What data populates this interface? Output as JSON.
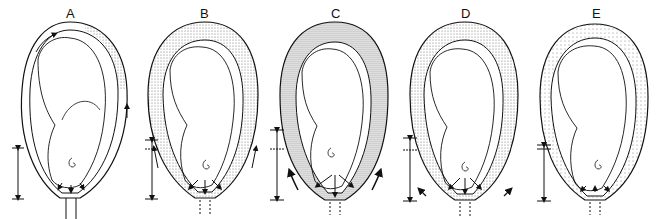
{
  "figure": {
    "stages": [
      {
        "label": "A",
        "x": 0,
        "wall": "thin",
        "stipple": "upper-right",
        "arrows": "top-clockwise"
      },
      {
        "label": "B",
        "x": 130,
        "wall": "thick",
        "stipple": "full-upper",
        "arrows": "lower-sides-up"
      },
      {
        "label": "C",
        "x": 260,
        "wall": "thickest",
        "stipple": "dense",
        "arrows": "lower-sides-up"
      },
      {
        "label": "D",
        "x": 390,
        "wall": "thick",
        "stipple": "full-upper",
        "arrows": "lower-sides-up"
      },
      {
        "label": "E",
        "x": 520,
        "wall": "thinning",
        "stipple": "light",
        "arrows": "small-inward"
      }
    ]
  },
  "colors": {
    "line": "#111111",
    "stipple": "#555555",
    "background": "#ffffff"
  }
}
